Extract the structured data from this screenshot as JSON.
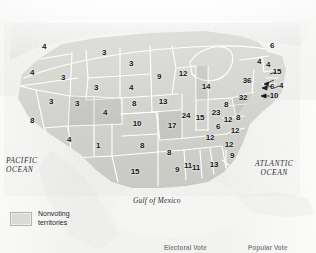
{
  "figure": {
    "name": "us-electoral-college-map",
    "type": "choropleth-map"
  },
  "geography_labels": {
    "pacific_ocean": "PACIFIC\nOCEAN",
    "pacific_ocean_line1": "PACIFIC",
    "pacific_ocean_line2": "OCEAN",
    "atlantic_ocean_line1": "ATLANTIC",
    "atlantic_ocean_line2": "OCEAN",
    "gulf_of_mexico": "Gulf of Mexico"
  },
  "legend": {
    "swatch_color": "#dadad8",
    "label_line1": "Nonvoting",
    "label_line2": "territories"
  },
  "bottom_captions": {
    "electoral_vote": "Electoral Vote",
    "popular_vote": "Popular Vote"
  },
  "colors": {
    "land_light": "#e0e0de",
    "land_mid": "#cfcfcc",
    "land_dark": "#bcbcb8",
    "border": "#ffffff",
    "text": "#18181a",
    "ocean": "#f4f4f3"
  },
  "chart_data": {
    "type": "map",
    "title": "",
    "value_label": "Electoral votes",
    "categories": [
      "Washington",
      "Oregon",
      "California",
      "Nevada",
      "Idaho",
      "Montana",
      "Wyoming",
      "Utah",
      "Arizona",
      "Colorado",
      "New Mexico",
      "North Dakota",
      "South Dakota",
      "Nebraska",
      "Kansas",
      "Oklahoma",
      "Texas",
      "Minnesota",
      "Iowa",
      "Missouri",
      "Arkansas",
      "Louisiana",
      "Wisconsin",
      "Illinois",
      "Michigan",
      "Indiana",
      "Ohio",
      "Kentucky",
      "Tennessee",
      "Mississippi",
      "Alabama",
      "Georgia",
      "Florida",
      "South Carolina",
      "North Carolina",
      "Virginia",
      "West Virginia",
      "Maryland",
      "Delaware",
      "Pennsylvania",
      "New York",
      "New Jersey",
      "Connecticut",
      "Rhode Island",
      "Massachusetts",
      "Vermont",
      "New Hampshire",
      "Maine"
    ],
    "values": [
      4,
      4,
      8,
      3,
      3,
      3,
      3,
      3,
      4,
      4,
      3,
      3,
      4,
      8,
      10,
      8,
      15,
      9,
      13,
      17,
      8,
      9,
      12,
      24,
      36,
      12,
      32,
      12,
      12,
      9,
      11,
      13,
      11,
      6,
      12,
      12,
      8,
      10,
      1,
      23,
      14,
      4,
      6,
      4,
      15,
      4,
      4,
      6
    ],
    "labels_on_map": [
      {
        "state": "Washington",
        "value": "4",
        "x": 44,
        "y": 47
      },
      {
        "state": "Oregon",
        "value": "4",
        "x": 32,
        "y": 73
      },
      {
        "state": "Idaho",
        "value": "3",
        "x": 63,
        "y": 78
      },
      {
        "state": "Montana",
        "value": "3",
        "x": 104,
        "y": 53
      },
      {
        "state": "Wyoming",
        "value": "3",
        "x": 96,
        "y": 88
      },
      {
        "state": "North Dakota",
        "value": "3",
        "x": 131,
        "y": 64
      },
      {
        "state": "South Dakota",
        "value": "4",
        "x": 131,
        "y": 88
      },
      {
        "state": "Nebraska",
        "value": "8",
        "x": 134,
        "y": 104
      },
      {
        "state": "Nevada",
        "value": "3",
        "x": 51,
        "y": 102
      },
      {
        "state": "Utah",
        "value": "3",
        "x": 77,
        "y": 104
      },
      {
        "state": "California",
        "value": "8",
        "x": 32,
        "y": 121
      },
      {
        "state": "Colorado",
        "value": "4",
        "x": 105,
        "y": 113
      },
      {
        "state": "Kansas",
        "value": "10",
        "x": 137,
        "y": 124
      },
      {
        "state": "Arizona",
        "value": "4",
        "x": 69,
        "y": 140
      },
      {
        "state": "New Mexico",
        "value": "1",
        "x": 98,
        "y": 146
      },
      {
        "state": "Oklahoma",
        "value": "8",
        "x": 142,
        "y": 146
      },
      {
        "state": "Texas",
        "value": "15",
        "x": 135,
        "y": 172
      },
      {
        "state": "Minnesota",
        "value": "9",
        "x": 159,
        "y": 77
      },
      {
        "state": "Iowa",
        "value": "13",
        "x": 163,
        "y": 102
      },
      {
        "state": "Missouri",
        "value": "17",
        "x": 172,
        "y": 126
      },
      {
        "state": "Arkansas",
        "value": "8",
        "x": 169,
        "y": 153
      },
      {
        "state": "Louisiana",
        "value": "9",
        "x": 177,
        "y": 170
      },
      {
        "state": "Wisconsin",
        "value": "12",
        "x": 183,
        "y": 74
      },
      {
        "state": "Illinois",
        "value": "24",
        "x": 186,
        "y": 116
      },
      {
        "state": "Michigan",
        "value": "14",
        "x": 206,
        "y": 87
      },
      {
        "state": "Indiana",
        "value": "15",
        "x": 200,
        "y": 118
      },
      {
        "state": "Ohio",
        "value": "23",
        "x": 216,
        "y": 113
      },
      {
        "state": "Kentucky",
        "value": "6",
        "x": 218,
        "y": 127
      },
      {
        "state": "Tennessee",
        "value": "12",
        "x": 210,
        "y": 138
      },
      {
        "state": "Mississippi",
        "value": "11",
        "x": 188,
        "y": 166
      },
      {
        "state": "Alabama",
        "value": "11",
        "x": 196,
        "y": 168
      },
      {
        "state": "Georgia",
        "value": "13",
        "x": 214,
        "y": 165
      },
      {
        "state": "Florida",
        "value": "9",
        "x": 232,
        "y": 156
      },
      {
        "state": "South Carolina",
        "value": "12",
        "x": 229,
        "y": 145
      },
      {
        "state": "North Carolina",
        "value": "12",
        "x": 235,
        "y": 131
      },
      {
        "state": "Virginia",
        "value": "12",
        "x": 228,
        "y": 120
      },
      {
        "state": "West Virginia",
        "value": "8",
        "x": 226,
        "y": 105
      },
      {
        "state": "Pennsylvania",
        "value": "32",
        "x": 243,
        "y": 98
      },
      {
        "state": "New York",
        "value": "36",
        "x": 247,
        "y": 81
      },
      {
        "state": "Maryland",
        "value": "8",
        "x": 238,
        "y": 118
      },
      {
        "state": "Vermont",
        "value": "4",
        "x": 259,
        "y": 62
      },
      {
        "state": "New Hampshire",
        "value": "4",
        "x": 268,
        "y": 65
      },
      {
        "state": "Maine",
        "value": "6",
        "x": 272,
        "y": 46
      },
      {
        "state": "Massachusetts",
        "value": "15",
        "x": 277,
        "y": 72
      },
      {
        "state": "Rhode Island",
        "value": "4",
        "x": 281,
        "y": 86
      },
      {
        "state": "Connecticut",
        "value": "6",
        "x": 272,
        "y": 87
      },
      {
        "state": "New Jersey",
        "value": "10",
        "x": 274,
        "y": 96
      }
    ]
  }
}
